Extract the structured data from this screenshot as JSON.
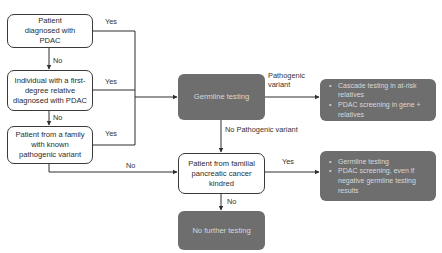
{
  "colors": {
    "line": "#2f2f2f",
    "white_box_border": "#3a3a3a",
    "dark_box_fill": "#6e6e6e",
    "dark_box_text": "#d8d8d8",
    "text": "#2b2b2b"
  },
  "nodes": {
    "diagnosed": {
      "text": "Patient diagnosed with PDAC"
    },
    "first_degree": {
      "text": "Individual with a first-degree relative diagnosed with PDAC"
    },
    "known_variant": {
      "text": "Patient from a family with known pathogenic variant"
    },
    "germline": {
      "text": "Germline testing"
    },
    "familial": {
      "text": "Patient from familial pancreatic cancer kindred"
    },
    "no_further": {
      "text": "No further testing"
    },
    "outcome_pathogenic": {
      "bullets": [
        "Cascade testing in at-risk relatives",
        "PDAC screening in gene + relatives"
      ]
    },
    "outcome_familial": {
      "bullets": [
        "Germline testing",
        "PDAC screening, even if negative germline testing results"
      ]
    }
  },
  "edge_labels": {
    "diagnosed_yes": "Yes",
    "diagnosed_no": "No",
    "first_degree_yes": "Yes",
    "first_degree_no": "No",
    "known_variant_yes": "Yes",
    "known_variant_no": "No",
    "pathogenic_variant_line1": "Pathogenic",
    "pathogenic_variant_line2": "variant",
    "no_pathogenic_variant": "No Pathogenic variant",
    "familial_yes": "Yes",
    "familial_no": "No"
  }
}
